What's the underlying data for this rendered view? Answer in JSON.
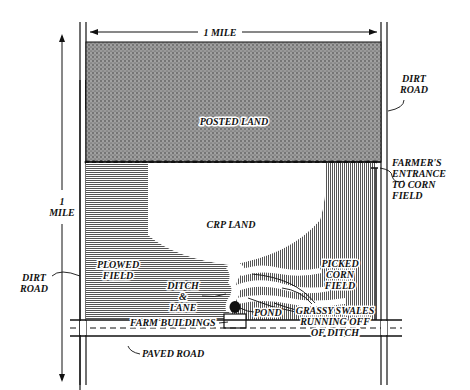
{
  "diagram": {
    "type": "site-map",
    "colors": {
      "ink": "#111111",
      "posted_fill": "#8a8a8a",
      "field_fill": "#b5b5b5",
      "background": "#ffffff"
    },
    "dimensions": {
      "width_label": "1 MILE",
      "height_label_line1": "1",
      "height_label_line2": "MILE"
    },
    "regions": {
      "posted_land": "POSTED LAND",
      "crp_land": "CRP LAND",
      "plowed_field_line1": "PLOWED",
      "plowed_field_line2": "FIELD",
      "picked_corn_line1": "PICKED",
      "picked_corn_line2": "CORN",
      "picked_corn_line3": "FIELD"
    },
    "callouts": {
      "dirt_road_right_line1": "DIRT",
      "dirt_road_right_line2": "ROAD",
      "dirt_road_left_line1": "DIRT",
      "dirt_road_left_line2": "ROAD",
      "entrance_line1": "FARMER'S",
      "entrance_line2": "ENTRANCE",
      "entrance_line3": "TO CORN",
      "entrance_line4": "FIELD",
      "ditch_line1": "DITCH",
      "ditch_line2": "&",
      "ditch_line3": "LANE",
      "swales_line1": "GRASSY SWALES",
      "swales_line2": "RUNNING OFF",
      "swales_line3": "OF DITCH",
      "pond": "POND",
      "farm_buildings": "FARM BUILDINGS",
      "paved_road": "PAVED ROAD"
    }
  }
}
